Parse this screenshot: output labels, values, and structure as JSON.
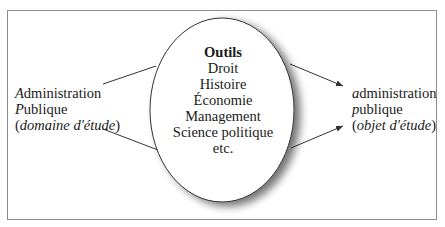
{
  "diagram": {
    "left": {
      "line1_initial": "A",
      "line1_rest": "dministration",
      "line2_initial": "P",
      "line2_rest": "ublique",
      "line3_open": "(",
      "line3_italic": "domaine d'étude",
      "line3_close": ")"
    },
    "center": {
      "title": "Outils",
      "items": [
        "Droit",
        "Histoire",
        "Économie",
        "Management",
        "Science politique",
        "etc."
      ]
    },
    "right": {
      "line1_initial": "a",
      "line1_rest": "dministration",
      "line2_initial": "p",
      "line2_rest": "ublique",
      "line3_open": "(",
      "line3_italic": "objet d'étude",
      "line3_close": ")"
    },
    "colors": {
      "stroke": "#333333",
      "frame": "#8c8c8c",
      "shadow": "#555555"
    }
  }
}
